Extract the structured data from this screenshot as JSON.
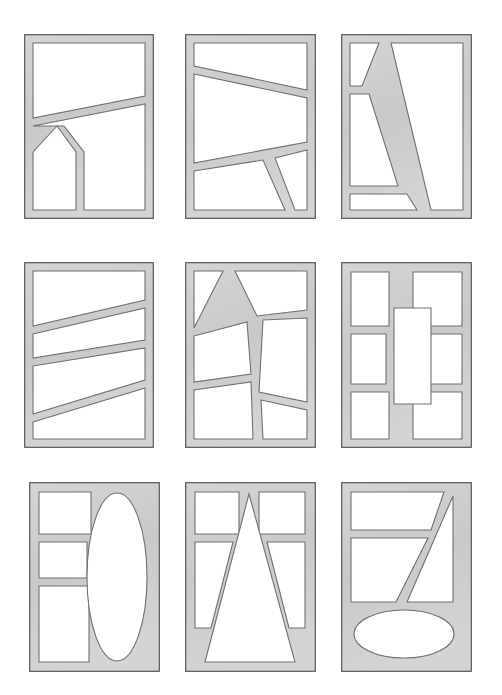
{
  "sheet": {
    "title": "Window mullion pattern sheet",
    "background_color": "#ffffff",
    "width": 502,
    "height": 695,
    "rows": 3,
    "columns": 3,
    "panel_count": 9
  },
  "style": {
    "frame_fill": "#c9c9c9",
    "frame_fill_light": "#d4d4d4",
    "frame_outline": "#4a4a4a",
    "glass_fill": "#ffffff",
    "glass_outline": "#707070",
    "outline_width": 1.1
  },
  "panels": [
    {
      "id": "panel-1",
      "name": "panel-top-left",
      "row": 1,
      "column": 1,
      "x": 24,
      "y": 34,
      "width": 130,
      "height": 185,
      "description": "Rectangular frame with one long rising diagonal mullion and a lower stepped mullion forming an L notch",
      "lights": 4,
      "shapes": [
        "quadrilateral",
        "quadrilateral",
        "quadrilateral",
        "quadrilateral"
      ],
      "glass": [
        "M 9,9 L 121,9 L 121,62 L 9,84 Z",
        "M 9,92 L 121,70 L 121,176 L 60,176 L 60,118 L 40,92 Z",
        "M 9,118 L 33,92 L 52,118 L 52,176 L 9,176 Z"
      ]
    },
    {
      "id": "panel-2",
      "name": "panel-top-center",
      "row": 1,
      "column": 2,
      "x": 185,
      "y": 34,
      "width": 131,
      "height": 185,
      "description": "Frame with two descending diagonal mullions and a short diagonal drop to the sill",
      "lights": 4,
      "shapes": [
        "quadrilateral",
        "quadrilateral",
        "quadrilateral",
        "quadrilateral"
      ],
      "glass": [
        "M 9,9 L 122,9 L 122,56 L 9,32 Z",
        "M 9,40 L 122,64 L 122,108 L 9,129 Z",
        "M 9,137 L 78,126 L 100,176 L 9,176 Z",
        "M 90,124 L 122,116 L 122,176 L 110,176 Z"
      ]
    },
    {
      "id": "panel-3",
      "name": "panel-top-right",
      "row": 1,
      "column": 3,
      "x": 341,
      "y": 34,
      "width": 131,
      "height": 185,
      "description": "Frame with one steep diagonal mullion crossing top to bottom and two short ribs on the left",
      "lights": 4,
      "shapes": [
        "triangle",
        "quadrilateral",
        "quadrilateral",
        "quadrilateral"
      ],
      "glass": [
        "M 9,9 L 38,9 L 21,52 L 9,52 Z",
        "M 9,60 L 28,60 L 57,152 L 9,152 Z",
        "M 9,160 L 66,160 L 76,176 L 9,176 Z",
        "M 50,9 L 122,9 L 122,176 L 90,176 Z"
      ]
    },
    {
      "id": "panel-4",
      "name": "panel-middle-left",
      "row": 2,
      "column": 1,
      "x": 24,
      "y": 262,
      "width": 130,
      "height": 186,
      "description": "Frame with three alternating diagonal mullions forming a zigzag of four lights",
      "lights": 4,
      "shapes": [
        "quadrilateral",
        "quadrilateral",
        "quadrilateral",
        "quadrilateral"
      ],
      "glass": [
        "M 9,9 L 121,9 L 121,38 L 9,64 Z",
        "M 9,72 L 121,46 L 121,78 L 9,96 Z",
        "M 9,104 L 121,86 L 121,118 L 9,152 Z",
        "M 9,160 L 121,126 L 121,177 L 9,177 Z"
      ]
    },
    {
      "id": "panel-5",
      "name": "panel-middle-center",
      "row": 2,
      "column": 2,
      "x": 185,
      "y": 262,
      "width": 131,
      "height": 186,
      "description": "Frame with a near vertical mullion crossed by two diagonals and an angled rib to the head",
      "lights": 6,
      "shapes": [
        "quadrilateral",
        "triangle",
        "quadrilateral",
        "quadrilateral",
        "quadrilateral",
        "quadrilateral"
      ],
      "glass": [
        "M 9,9 L 38,9 L 9,66 Z",
        "M 9,74 L 62,60 L 66,112 L 9,120 Z",
        "M 50,9 L 122,9 L 122,48 L 72,54 Z",
        "M 78,58 L 122,56 L 122,140 L 74,130 Z",
        "M 9,128 L 66,120 L 68,177 L 9,177 Z",
        "M 76,138 L 122,148 L 122,177 L 78,177 Z"
      ]
    },
    {
      "id": "panel-6",
      "name": "panel-middle-right",
      "row": 2,
      "column": 3,
      "x": 341,
      "y": 262,
      "width": 131,
      "height": 186,
      "description": "Frame with a large central vertical rectangular light surrounded by six smaller rectangular lights",
      "lights": 7,
      "shapes": [
        "rectangle",
        "rectangle",
        "rectangle",
        "rectangle",
        "rectangle",
        "rectangle",
        "rectangle"
      ],
      "glass": [
        "M 10,10 L 48,10 L 48,64 L 10,64 Z",
        "M 72,10 L 121,10 L 121,64 L 72,64 Z",
        "M 10,72 L 45,72 L 45,122 L 10,122 Z",
        "M 76,72 L 121,72 L 121,122 L 76,122 Z",
        "M 10,130 L 48,130 L 48,177 L 10,177 Z",
        "M 72,130 L 121,130 L 121,177 L 72,177 Z",
        "M 53,46 L 90,46 L 90,142 L 53,142 Z"
      ]
    },
    {
      "id": "panel-7",
      "name": "panel-bottom-left",
      "row": 3,
      "column": 1,
      "x": 29,
      "y": 482,
      "width": 131,
      "height": 190,
      "description": "Frame with three stacked lights on the left and one tall elliptical light on the right",
      "lights": 4,
      "shapes": [
        "quadrilateral",
        "quadrilateral",
        "quadrilateral",
        "ellipse"
      ],
      "ellipse": {
        "cx": 88,
        "cy": 95,
        "rx": 30,
        "ry": 84
      },
      "glass": [
        "M 10,10 L 62,10 L 62,52 L 10,52 Z",
        "M 10,60 L 58,60 L 58,96 L 10,96 Z",
        "M 10,104 L 60,104 L 60,180 L 10,180 Z"
      ]
    },
    {
      "id": "panel-8",
      "name": "panel-bottom-center",
      "row": 3,
      "column": 2,
      "x": 185,
      "y": 482,
      "width": 131,
      "height": 190,
      "description": "Frame with a large central triangular light apexed at the head, two rectangular lights above and two tapered side lights",
      "lights": 5,
      "shapes": [
        "triangle",
        "rectangle",
        "rectangle",
        "quadrilateral",
        "quadrilateral"
      ],
      "glass": [
        "M 10,10 L 54,10 L 54,52 L 10,52 Z",
        "M 74,10 L 120,10 L 120,52 L 74,52 Z",
        "M 10,60 L 48,60 L 26,146 L 10,146 Z",
        "M 82,60 L 120,60 L 120,146 L 104,146 Z",
        "M 64,12 L 110,180 L 20,180 Z"
      ]
    },
    {
      "id": "panel-9",
      "name": "panel-bottom-right",
      "row": 3,
      "column": 3,
      "x": 341,
      "y": 482,
      "width": 131,
      "height": 190,
      "description": "Frame with two stacked upper lights cut by a rising diagonal mullion and one wide elliptical light at the sill",
      "lights": 4,
      "shapes": [
        "quadrilateral",
        "quadrilateral",
        "triangle",
        "ellipse"
      ],
      "ellipse": {
        "cx": 63,
        "cy": 152,
        "rx": 50,
        "ry": 24
      },
      "glass": [
        "M 10,10 L 103,10 L 90,48 L 10,48 Z",
        "M 10,56 L 87,56 L 55,120 L 10,120 Z",
        "M 112,14 L 112,120 L 66,120 Z"
      ]
    }
  ]
}
